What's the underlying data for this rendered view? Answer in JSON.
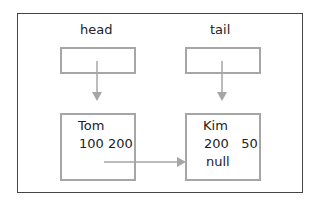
{
  "diagram": {
    "pointers": [
      {
        "label": "head"
      },
      {
        "label": "tail"
      }
    ],
    "nodes": [
      {
        "name": "Tom",
        "line2": "100 200"
      },
      {
        "name": "Kim",
        "line2": "200   50",
        "line3": "null"
      }
    ],
    "colors": {
      "border": "#444444",
      "box": "#a6a6a6",
      "arrow": "#a6a6a6"
    }
  }
}
